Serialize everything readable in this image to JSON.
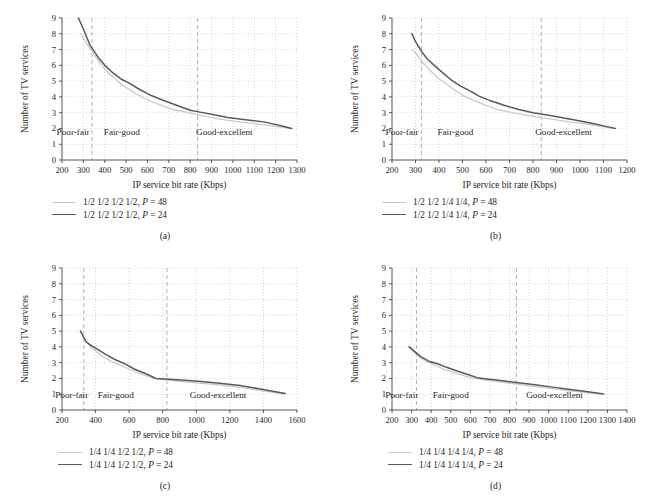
{
  "figure": {
    "panel_count": 4,
    "shared": {
      "ylabel": "Number of TV services",
      "xlabel": "IP service bit rate (Kbps)",
      "yticks": [
        "0",
        "1",
        "2",
        "3",
        "4",
        "5",
        "6",
        "7",
        "8",
        "9"
      ],
      "regions": [
        "Poor-fair",
        "Fair-good",
        "Good-excellent"
      ],
      "colors": {
        "series_p48": "#c9c9c9",
        "series_p24": "#595959",
        "grid": "#bdbdbd",
        "divider": "#b0b0b0",
        "axis": "#555555"
      }
    },
    "panels": [
      {
        "id": "a",
        "caption": "(a)",
        "legend": [
          {
            "label": "1/2 1/2 1/2 1/2, P = 48",
            "style": "light"
          },
          {
            "label": "1/2 1/2 1/2 1/2, P = 24",
            "style": "dark"
          }
        ],
        "chart_data": {
          "type": "line",
          "title": "",
          "xlabel": "IP service bit rate (Kbps)",
          "ylabel": "Number of TV services",
          "xlim": [
            200,
            1300
          ],
          "ylim": [
            0,
            9
          ],
          "xticks": [
            200,
            300,
            400,
            500,
            600,
            700,
            800,
            900,
            1000,
            1100,
            1200,
            1300
          ],
          "yticks": [
            0,
            1,
            2,
            3,
            4,
            5,
            6,
            7,
            8,
            9
          ],
          "grid": true,
          "legend_position": "below-left",
          "region_dividers": [
            340,
            835
          ],
          "region_labels": [
            "Poor-fair",
            "Fair-good",
            "Good-excellent"
          ],
          "region_label_x": [
            252,
            480,
            960
          ],
          "region_label_y": 1.6,
          "series": [
            {
              "name": "1/2 1/2 1/2 1/2, P = 48",
              "color": "#c9c9c9",
              "x": [
                288,
                310,
                340,
                360,
                385,
                420,
                460,
                500,
                545,
                600,
                660,
                720,
                790,
                860,
                930,
                1010,
                1100,
                1190,
                1270
              ],
              "y": [
                8.0,
                7.5,
                6.9,
                6.5,
                6.0,
                5.5,
                5.0,
                4.6,
                4.2,
                3.8,
                3.5,
                3.2,
                3.0,
                2.8,
                2.6,
                2.45,
                2.3,
                2.15,
                2.0
              ]
            },
            {
              "name": "1/2 1/2 1/2 1/2, P = 24",
              "color": "#595959",
              "x": [
                277,
                300,
                330,
                345,
                370,
                400,
                440,
                480,
                510,
                560,
                615,
                670,
                730,
                800,
                840,
                900,
                975,
                1060,
                1150,
                1230,
                1275
              ],
              "y": [
                9.0,
                8.3,
                7.3,
                7.0,
                6.5,
                6.0,
                5.5,
                5.1,
                4.9,
                4.5,
                4.1,
                3.8,
                3.5,
                3.15,
                3.05,
                2.9,
                2.7,
                2.55,
                2.4,
                2.15,
                2.0
              ]
            }
          ]
        }
      },
      {
        "id": "b",
        "caption": "(b)",
        "legend": [
          {
            "label": "1/2 1/2 1/4 1/4, P = 48",
            "style": "light"
          },
          {
            "label": "1/2 1/2 1/4 1/4, P = 24",
            "style": "dark"
          }
        ],
        "chart_data": {
          "type": "line",
          "title": "",
          "xlabel": "IP service bit rate (Kbps)",
          "ylabel": "Number of TV services",
          "xlim": [
            200,
            1200
          ],
          "ylim": [
            0,
            9
          ],
          "xticks": [
            200,
            300,
            400,
            500,
            600,
            700,
            800,
            900,
            1000,
            1100,
            1200
          ],
          "yticks": [
            0,
            1,
            2,
            3,
            4,
            5,
            6,
            7,
            8,
            9
          ],
          "grid": true,
          "legend_position": "below-left",
          "region_dividers": [
            325,
            835
          ],
          "region_labels": [
            "Poor-fair",
            "Fair-good",
            "Good-excellent"
          ],
          "region_label_x": [
            243,
            470,
            930
          ],
          "region_label_y": 1.6,
          "series": [
            {
              "name": "1/2 1/2 1/4 1/4, P = 48",
              "color": "#c9c9c9",
              "x": [
                287,
                310,
                330,
                360,
                395,
                425,
                460,
                500,
                545,
                595,
                650,
                710,
                770,
                830,
                900,
                960,
                1020,
                1080,
                1140
              ],
              "y": [
                7.0,
                6.6,
                6.2,
                5.7,
                5.2,
                4.9,
                4.5,
                4.1,
                3.8,
                3.5,
                3.2,
                3.0,
                2.85,
                2.7,
                2.55,
                2.4,
                2.3,
                2.15,
                2.0
              ]
            },
            {
              "name": "1/2 1/2 1/4 1/4, P = 24",
              "color": "#595959",
              "x": [
                285,
                300,
                325,
                350,
                380,
                410,
                450,
                490,
                530,
                570,
                620,
                680,
                740,
                800,
                860,
                920,
                990,
                1060,
                1120,
                1150
              ],
              "y": [
                8.0,
                7.5,
                6.9,
                6.4,
                6.0,
                5.6,
                5.1,
                4.7,
                4.4,
                4.05,
                3.75,
                3.45,
                3.2,
                3.0,
                2.85,
                2.7,
                2.5,
                2.3,
                2.1,
                2.0
              ]
            }
          ]
        }
      },
      {
        "id": "c",
        "caption": "(c)",
        "legend": [
          {
            "label": "1/4 1/4 1/2 1/2, P = 48",
            "style": "light"
          },
          {
            "label": "1/4 1/4 1/2 1/2, P = 24",
            "style": "dark"
          }
        ],
        "chart_data": {
          "type": "line",
          "title": "",
          "xlabel": "IP service bit rate (Kbps)",
          "ylabel": "Number of TV services",
          "xlim": [
            200,
            1600
          ],
          "ylim": [
            0,
            9
          ],
          "xticks": [
            200,
            400,
            600,
            800,
            1000,
            1200,
            1400,
            1600
          ],
          "yticks": [
            0,
            1,
            2,
            3,
            4,
            5,
            6,
            7,
            8,
            9
          ],
          "grid": true,
          "legend_position": "below-left",
          "region_dividers": [
            330,
            825
          ],
          "region_labels": [
            "Poor-fair",
            "Fair-good",
            "Good-excellent"
          ],
          "region_label_x": [
            258,
            520,
            1130
          ],
          "region_label_y": 0.75,
          "series": [
            {
              "name": "1/4 1/4 1/2 1/2, P = 48",
              "color": "#c9c9c9",
              "x": [
                312,
                340,
                370,
                400,
                440,
                490,
                545,
                610,
                680,
                750,
                830,
                920,
                1020,
                1130,
                1250,
                1380,
                1520
              ],
              "y": [
                5.0,
                4.4,
                4.0,
                3.75,
                3.4,
                3.1,
                2.85,
                2.55,
                2.25,
                2.0,
                1.9,
                1.8,
                1.7,
                1.6,
                1.45,
                1.25,
                1.03
              ]
            },
            {
              "name": "1/4 1/4 1/2 1/2, P = 24",
              "color": "#595959",
              "x": [
                310,
                345,
                380,
                420,
                465,
                515,
                570,
                630,
                700,
                760,
                840,
                930,
                1030,
                1140,
                1260,
                1390,
                1530
              ],
              "y": [
                5.0,
                4.3,
                4.05,
                3.8,
                3.5,
                3.2,
                2.95,
                2.6,
                2.3,
                2.0,
                1.95,
                1.88,
                1.8,
                1.7,
                1.55,
                1.32,
                1.05
              ]
            }
          ]
        }
      },
      {
        "id": "d",
        "caption": "(d)",
        "legend": [
          {
            "label": "1/4 1/4 1/4 1/4, P = 48",
            "style": "light"
          },
          {
            "label": "1/4 1/4 1/4 1/4, P = 24",
            "style": "dark"
          }
        ],
        "chart_data": {
          "type": "line",
          "title": "",
          "xlabel": "IP service bit rate (Kbps)",
          "ylabel": "Number of TV services",
          "xlim": [
            200,
            1400
          ],
          "ylim": [
            0,
            9
          ],
          "xticks": [
            200,
            300,
            400,
            500,
            600,
            700,
            800,
            900,
            1000,
            1100,
            1200,
            1300,
            1400
          ],
          "yticks": [
            0,
            1,
            2,
            3,
            4,
            5,
            6,
            7,
            8,
            9
          ],
          "grid": true,
          "legend_position": "below-left",
          "region_dividers": [
            325,
            835
          ],
          "region_labels": [
            "Poor-fair",
            "Fair-good",
            "Good-excellent"
          ],
          "region_label_x": [
            250,
            500,
            1030
          ],
          "region_label_y": 0.78,
          "series": [
            {
              "name": "1/4 1/4 1/4 1/4, P = 48",
              "color": "#c9c9c9",
              "x": [
                285,
                310,
                340,
                380,
                420,
                460,
                510,
                560,
                620,
                680,
                750,
                830,
                910,
                1000,
                1090,
                1180,
                1265
              ],
              "y": [
                4.0,
                3.7,
                3.35,
                3.05,
                2.85,
                2.6,
                2.4,
                2.2,
                2.0,
                1.9,
                1.78,
                1.65,
                1.52,
                1.38,
                1.25,
                1.12,
                1.0
              ]
            },
            {
              "name": "1/4 1/4 1/4 1/4, P = 24",
              "color": "#595959",
              "x": [
                288,
                315,
                345,
                390,
                430,
                475,
                525,
                575,
                635,
                695,
                765,
                845,
                930,
                1020,
                1110,
                1200,
                1280
              ],
              "y": [
                4.0,
                3.72,
                3.4,
                3.08,
                2.95,
                2.72,
                2.5,
                2.3,
                2.05,
                1.95,
                1.85,
                1.73,
                1.6,
                1.45,
                1.3,
                1.15,
                1.02
              ]
            }
          ]
        }
      }
    ]
  }
}
